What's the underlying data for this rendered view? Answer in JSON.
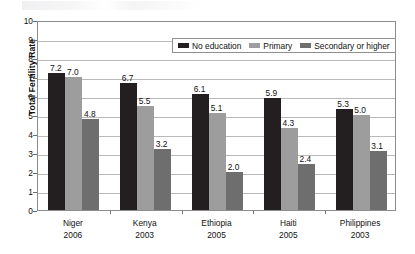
{
  "chart_data": {
    "type": "bar",
    "title": "",
    "subtitle": "",
    "xlabel": "",
    "ylabel": "Total Fertility Rate",
    "ylim": [
      0,
      10
    ],
    "ytick_step": 1,
    "yticks": [
      "10",
      "9",
      "8",
      "7",
      "6",
      "5",
      "4",
      "3",
      "2",
      "1",
      "0"
    ],
    "grid": true,
    "grid_axis": "y",
    "legend_position": "upper-right-inside",
    "categories": [
      {
        "name": "Niger",
        "year": "2006"
      },
      {
        "name": "Kenya",
        "year": "2003"
      },
      {
        "name": "Ethiopia",
        "year": "2005"
      },
      {
        "name": "Haiti",
        "year": "2005"
      },
      {
        "name": "Philippines",
        "year": "2003"
      }
    ],
    "category_labels": [
      "Niger",
      "Kenya",
      "Ethiopia",
      "Haiti",
      "Philippines"
    ],
    "category_years": [
      "2006",
      "2003",
      "2005",
      "2005",
      "2003"
    ],
    "series": [
      {
        "name": "No education",
        "color": "#231f20",
        "values": [
          7.2,
          6.7,
          6.1,
          5.9,
          5.3
        ],
        "data_labels": [
          "7.2",
          "6.7",
          "6.1",
          "5.9",
          "5.3"
        ]
      },
      {
        "name": "Primary",
        "color": "#9d9d9d",
        "values": [
          7.0,
          5.5,
          5.1,
          4.3,
          5.0
        ],
        "data_labels": [
          "7.0",
          "5.5",
          "5.1",
          "4.3",
          "5.0"
        ]
      },
      {
        "name": "Secondary or higher",
        "color": "#6e6e6e",
        "values": [
          4.8,
          3.2,
          2.0,
          2.4,
          3.1
        ],
        "data_labels": [
          "4.8",
          "3.2",
          "2.0",
          "2.4",
          "3.1"
        ]
      }
    ]
  },
  "legend": {
    "items": [
      {
        "label": "No education",
        "swatch": "s0"
      },
      {
        "label": "Primary",
        "swatch": "s1"
      },
      {
        "label": "Secondary or higher",
        "swatch": "s2"
      }
    ]
  },
  "axes": {
    "y_title": "Total Fertility Rate"
  }
}
